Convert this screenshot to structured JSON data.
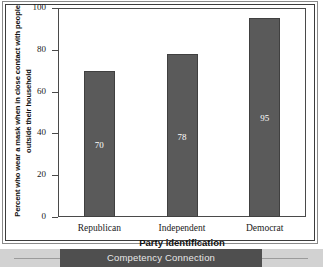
{
  "chart_data": {
    "type": "bar",
    "title": "",
    "categories": [
      "Republican",
      "Independent",
      "Democrat"
    ],
    "values": [
      70,
      78,
      95
    ],
    "value_labels": [
      "70",
      "78",
      "95"
    ],
    "xlabel": "Party identification",
    "ylabel": "Percent who wear a mask when in close contact with people outside their household",
    "ylim": [
      0,
      100
    ],
    "yticks": [
      0,
      20,
      40,
      60,
      80,
      100
    ],
    "ytick_labels": [
      "0",
      "20",
      "40",
      "60",
      "80",
      "100"
    ],
    "grid": false,
    "legend": false,
    "bar_color": "#5a5a5a",
    "bar_edge_color": "#404040",
    "value_label_color": "#ffffff"
  },
  "banner": {
    "text": "Competency Connection",
    "background": "#4f4f4f",
    "surround": "#d2d2d2"
  },
  "frame": {
    "outer_color": "#8a8a8a",
    "inner_color": "#3d3d3d",
    "axis_color": "#4a4a4a",
    "background": "#ffffff"
  }
}
